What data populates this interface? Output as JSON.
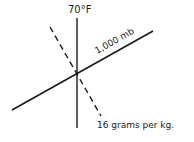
{
  "diagram": {
    "colors": {
      "ink": "#1a1a1a",
      "background": "#ffffff"
    },
    "lines": [
      {
        "id": "isotherm",
        "style": "solid",
        "label": "70°F",
        "x1": 77,
        "y1": 18,
        "x2": 77,
        "y2": 128
      },
      {
        "id": "isobar",
        "style": "solid",
        "label": "1,000 mb",
        "x1": 12,
        "y1": 110,
        "x2": 153,
        "y2": 31
      },
      {
        "id": "mixing-ratio",
        "style": "dashed",
        "label": "16 grams per kg.",
        "x1": 50,
        "y1": 27,
        "x2": 101,
        "y2": 116
      }
    ],
    "labels": {
      "temperature": "70°F",
      "pressure": "1,000 mb",
      "moisture": "16 grams per kg."
    }
  }
}
